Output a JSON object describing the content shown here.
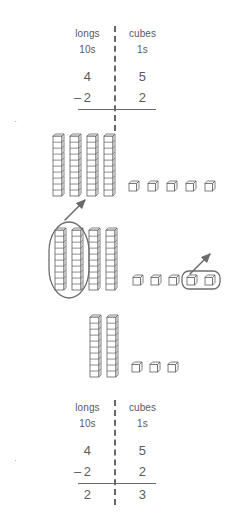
{
  "page": {
    "width": 230,
    "height": 528,
    "ink_color": "#5a5a5a"
  },
  "top_table": {
    "headers": {
      "left": "longs",
      "right": "cubes"
    },
    "subheaders": {
      "left": "10s",
      "right": "1s"
    },
    "minuend": {
      "tens": "4",
      "ones": "5"
    },
    "operator": "–",
    "subtrahend": {
      "tens": "2",
      "ones": "2"
    },
    "difference": {
      "tens": "",
      "ones": ""
    }
  },
  "bottom_table": {
    "headers": {
      "left": "longs",
      "right": "cubes"
    },
    "subheaders": {
      "left": "10s",
      "right": "1s"
    },
    "minuend": {
      "tens": "4",
      "ones": "5"
    },
    "operator": "–",
    "subtrahend": {
      "tens": "2",
      "ones": "2"
    },
    "difference": {
      "tens": "2",
      "ones": "3"
    }
  },
  "block_rows": [
    {
      "id": "start",
      "caption": "starting amount",
      "longs": 4,
      "cubes": 5,
      "longs_removed": 0,
      "cubes_removed": 0,
      "has_ring": false,
      "has_arrow": false
    },
    {
      "id": "take-away",
      "caption": "take away 2 longs and 2 cubes",
      "longs": 4,
      "cubes": 5,
      "longs_removed": 2,
      "cubes_removed": 2,
      "has_ring": true,
      "has_arrow": true
    },
    {
      "id": "result",
      "caption": "what is left",
      "longs": 2,
      "cubes": 3,
      "longs_removed": 0,
      "cubes_removed": 0,
      "has_ring": false,
      "has_arrow": false
    }
  ],
  "chart_data": {
    "type": "table",
    "columns": [
      "longs (10s)",
      "cubes (1s)"
    ],
    "rows": [
      {
        "label": "minuend",
        "values": [
          4,
          5
        ]
      },
      {
        "label": "subtrahend",
        "values": [
          2,
          2
        ]
      },
      {
        "label": "difference",
        "values": [
          2,
          3
        ]
      }
    ],
    "block_counts": [
      {
        "stage": "start",
        "longs": 4,
        "cubes": 5
      },
      {
        "stage": "remove",
        "longs": 2,
        "cubes": 2
      },
      {
        "stage": "result",
        "longs": 2,
        "cubes": 3
      }
    ]
  }
}
